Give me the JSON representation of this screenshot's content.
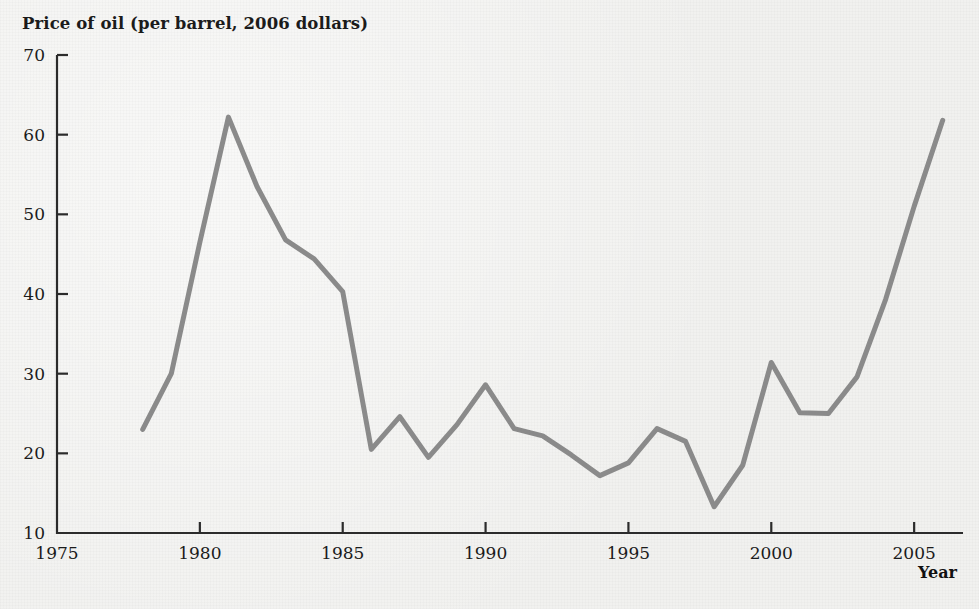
{
  "chart_data": {
    "type": "line",
    "title": "Price of oil (per barrel, 2006 dollars)",
    "xlabel": "Year",
    "ylabel": "",
    "xlim": [
      1975,
      2006.5
    ],
    "ylim": [
      10,
      70
    ],
    "xticks": [
      1975,
      1980,
      1985,
      1990,
      1995,
      2000,
      2005
    ],
    "xtick_labels": [
      "1975",
      "1980",
      "1985",
      "1990",
      "1995",
      "2000",
      "2005"
    ],
    "yticks": [
      10,
      20,
      30,
      40,
      50,
      60,
      70
    ],
    "ytick_labels": [
      "10",
      "20",
      "30",
      "40",
      "50",
      "60",
      "70"
    ],
    "grid": false,
    "legend": false,
    "line_color": "#8a8a8a",
    "line_width": 5,
    "background_color": "#f1f1ef",
    "axis_color": "#2b2b2b",
    "x": [
      1978,
      1979,
      1980,
      1981,
      1982,
      1983,
      1984,
      1985,
      1986,
      1987,
      1988,
      1989,
      1990,
      1991,
      1992,
      1993,
      1994,
      1995,
      1996,
      1997,
      1998,
      1999,
      2000,
      2001,
      2002,
      2003,
      2004,
      2005,
      2006
    ],
    "values": [
      23.0,
      30.0,
      46.5,
      62.2,
      53.5,
      46.8,
      44.4,
      40.3,
      20.5,
      24.6,
      19.5,
      23.6,
      28.6,
      23.1,
      22.2,
      19.8,
      17.2,
      18.8,
      23.1,
      21.5,
      13.3,
      18.5,
      31.4,
      25.1,
      25.0,
      29.6,
      39.3,
      51.0,
      61.8
    ],
    "series": [
      {
        "name": "Price of oil (per barrel, 2006 dollars)",
        "x": [
          1978,
          1979,
          1980,
          1981,
          1982,
          1983,
          1984,
          1985,
          1986,
          1987,
          1988,
          1989,
          1990,
          1991,
          1992,
          1993,
          1994,
          1995,
          1996,
          1997,
          1998,
          1999,
          2000,
          2001,
          2002,
          2003,
          2004,
          2005,
          2006
        ],
        "values": [
          23.0,
          30.0,
          46.5,
          62.2,
          53.5,
          46.8,
          44.4,
          40.3,
          20.5,
          24.6,
          19.5,
          23.6,
          28.6,
          23.1,
          22.2,
          19.8,
          17.2,
          18.8,
          23.1,
          21.5,
          13.3,
          18.5,
          31.4,
          25.1,
          25.0,
          29.6,
          39.3,
          51.0,
          61.8
        ]
      }
    ],
    "annotations": []
  }
}
